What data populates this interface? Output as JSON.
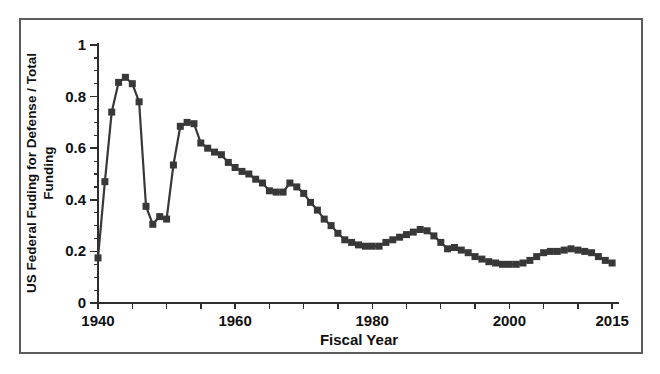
{
  "figure": {
    "background": "#ffffff",
    "frame_border_color": "#5c5c5c"
  },
  "chart_data": {
    "type": "line",
    "title": "",
    "xlabel": "Fiscal Year",
    "ylabel": "US Federal Fuding for Defense / Total Funding",
    "ylabel_lines": [
      "US Federal Fuding for Defense / Total",
      "Funding"
    ],
    "x": [
      1940,
      1941,
      1942,
      1943,
      1944,
      1945,
      1946,
      1947,
      1948,
      1949,
      1950,
      1951,
      1952,
      1953,
      1954,
      1955,
      1956,
      1957,
      1958,
      1959,
      1960,
      1961,
      1962,
      1963,
      1964,
      1965,
      1966,
      1967,
      1968,
      1969,
      1970,
      1971,
      1972,
      1973,
      1974,
      1975,
      1976,
      1977,
      1978,
      1979,
      1980,
      1981,
      1982,
      1983,
      1984,
      1985,
      1986,
      1987,
      1988,
      1989,
      1990,
      1991,
      1992,
      1993,
      1994,
      1995,
      1996,
      1997,
      1998,
      1999,
      2000,
      2001,
      2002,
      2003,
      2004,
      2005,
      2006,
      2007,
      2008,
      2009,
      2010,
      2011,
      2012,
      2013,
      2014,
      2015
    ],
    "values": [
      0.175,
      0.47,
      0.74,
      0.855,
      0.875,
      0.85,
      0.78,
      0.375,
      0.305,
      0.335,
      0.325,
      0.535,
      0.685,
      0.7,
      0.695,
      0.62,
      0.6,
      0.585,
      0.575,
      0.545,
      0.525,
      0.51,
      0.5,
      0.48,
      0.465,
      0.435,
      0.43,
      0.43,
      0.465,
      0.45,
      0.425,
      0.39,
      0.36,
      0.325,
      0.3,
      0.27,
      0.245,
      0.235,
      0.225,
      0.22,
      0.22,
      0.22,
      0.235,
      0.245,
      0.255,
      0.265,
      0.275,
      0.285,
      0.28,
      0.26,
      0.235,
      0.21,
      0.215,
      0.205,
      0.195,
      0.18,
      0.17,
      0.16,
      0.155,
      0.15,
      0.15,
      0.15,
      0.155,
      0.165,
      0.18,
      0.195,
      0.2,
      0.2,
      0.205,
      0.21,
      0.205,
      0.2,
      0.195,
      0.18,
      0.165,
      0.155
    ],
    "xlim": [
      1940,
      2016
    ],
    "ylim": [
      0,
      1
    ],
    "x_labeled_ticks": [
      {
        "year": 1940,
        "label": "1940"
      },
      {
        "year": 1960,
        "label": "1960"
      },
      {
        "year": 1980,
        "label": "1980"
      },
      {
        "year": 2000,
        "label": "2000"
      },
      {
        "year": 2015,
        "label": "2015"
      }
    ],
    "x_minor_tick_step_years": 5,
    "y_ticks": [
      {
        "value": 0,
        "label": "0"
      },
      {
        "value": 0.2,
        "label": "0.2"
      },
      {
        "value": 0.4,
        "label": "0.4"
      },
      {
        "value": 0.6,
        "label": "0.6"
      },
      {
        "value": 0.8,
        "label": "0.8"
      },
      {
        "value": 1,
        "label": "1"
      }
    ],
    "y_minor_tick_step": 0.05,
    "grid": false,
    "legend": "none",
    "line_color": "#383838",
    "axis_color": "#2e2e2e",
    "text_color": "#111111",
    "marker": "square",
    "marker_size_px": 7
  }
}
